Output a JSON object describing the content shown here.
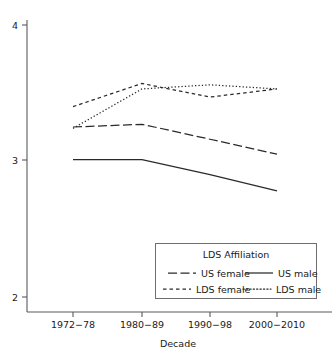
{
  "chart_data": {
    "type": "line",
    "title": "",
    "xlabel": "Decade",
    "ylabel": "",
    "categories": [
      "1972−78",
      "1980−89",
      "1990−98",
      "2000−2010"
    ],
    "ylim": [
      2,
      4
    ],
    "yticks": [
      2,
      3,
      4
    ],
    "ytick_labels": [
      "2",
      "3",
      "4"
    ],
    "grid": false,
    "legend_position": "inside-bottom-right",
    "legend_title": "LDS Affiliation",
    "series": [
      {
        "name": "US female",
        "style": "long-dash",
        "values": [
          3.25,
          3.27,
          3.16,
          3.05
        ]
      },
      {
        "name": "US male",
        "style": "solid",
        "values": [
          3.01,
          3.01,
          2.9,
          2.78
        ]
      },
      {
        "name": "LDS female",
        "style": "short-dash",
        "values": [
          3.4,
          3.57,
          3.47,
          3.53
        ]
      },
      {
        "name": "LDS male",
        "style": "dotted",
        "values": [
          3.24,
          3.53,
          3.56,
          3.53
        ]
      }
    ]
  },
  "legend": {
    "title": "LDS Affiliation",
    "entries": [
      {
        "label": "US female",
        "style": "long-dash"
      },
      {
        "label": "US male",
        "style": "solid"
      },
      {
        "label": "LDS female",
        "style": "short-dash"
      },
      {
        "label": "LDS male",
        "style": "dotted"
      }
    ]
  },
  "axes": {
    "x_title": "Decade",
    "x_tick_labels": [
      "1972−78",
      "1980−89",
      "1990−98",
      "2000−2010"
    ],
    "y_tick_labels": [
      "4",
      "3",
      "2"
    ]
  },
  "colors": {
    "line": "#2a2a2a",
    "axis": "#5a5a5a",
    "legend_border": "#6e6e6e",
    "background": "#ffffff"
  }
}
